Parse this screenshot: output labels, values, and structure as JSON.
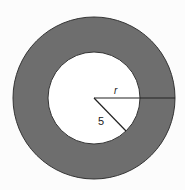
{
  "diagram": {
    "type": "annulus",
    "outer_region_color": "#6e6e6e",
    "inner_region_color": "#ffffff",
    "stroke_color": "#222222",
    "labels": {
      "outer_radius": "r",
      "inner_radius": "5"
    }
  }
}
